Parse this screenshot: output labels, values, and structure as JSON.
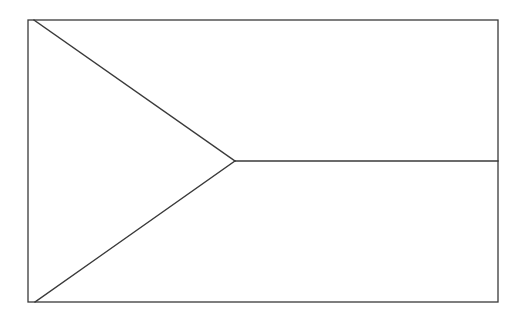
{
  "diagram": {
    "title": "",
    "stroke_color": "#3a3a3a",
    "background": "#ffffff",
    "frame": {
      "x": 28,
      "y": 20,
      "width": 470,
      "height": 282
    },
    "triangle": {
      "top": {
        "x": 34,
        "y": 20
      },
      "apex": {
        "x": 235,
        "y": 161
      },
      "bottom": {
        "x": 35,
        "y": 302
      }
    },
    "divider": {
      "x1": 235,
      "y1": 161,
      "x2": 498,
      "y2": 161
    }
  }
}
